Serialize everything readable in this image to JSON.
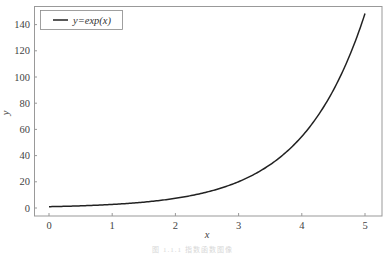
{
  "chart_data": {
    "type": "line",
    "title": "",
    "xlabel": "x",
    "ylabel": "y",
    "xlim": [
      -0.25,
      5.25
    ],
    "ylim": [
      -7.4,
      155.8
    ],
    "grid": false,
    "legend_position": "upper left",
    "x_ticks": [
      0,
      1,
      2,
      3,
      4,
      5
    ],
    "y_ticks": [
      0,
      20,
      40,
      60,
      80,
      100,
      120,
      140
    ],
    "series": [
      {
        "name": "y=exp(x)",
        "color": "#222222",
        "function": "exp(x)",
        "x": [
          0,
          0.5,
          1,
          1.5,
          2,
          2.5,
          3,
          3.5,
          4,
          4.5,
          5
        ],
        "values": [
          1.0,
          1.65,
          2.72,
          4.48,
          7.39,
          12.18,
          20.09,
          33.12,
          54.6,
          90.02,
          148.41
        ]
      }
    ]
  },
  "legend": {
    "label": "y=exp(x)"
  },
  "axes": {
    "xlabel": "x",
    "ylabel": "y"
  },
  "caption": "图 1.1.1  指数函数图像"
}
